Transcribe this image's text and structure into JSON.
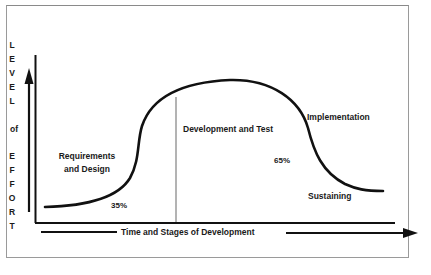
{
  "diagram": {
    "y_axis_label_letters": [
      "L",
      "E",
      "V",
      "E",
      "L",
      "",
      "of",
      "",
      "E",
      "F",
      "F",
      "O",
      "R",
      "T"
    ],
    "x_axis_label": "Time and Stages of Development",
    "phases": [
      {
        "label_lines": [
          "Requirements",
          "and Design"
        ],
        "percent": "35%"
      },
      {
        "label_lines": [
          "Development and Test"
        ],
        "percent": "65%"
      },
      {
        "label_lines": [
          "Implementation"
        ]
      },
      {
        "label_lines": [
          "Sustaining"
        ]
      }
    ],
    "phase_divider": "vertical gray line between Requirements/Design and Development/Test",
    "colors": {
      "line": "#111111",
      "divider": "#a0a0a0",
      "frame": "#9a9a9a",
      "text": "#1a1a1a"
    }
  },
  "caption": {
    "text": ""
  }
}
